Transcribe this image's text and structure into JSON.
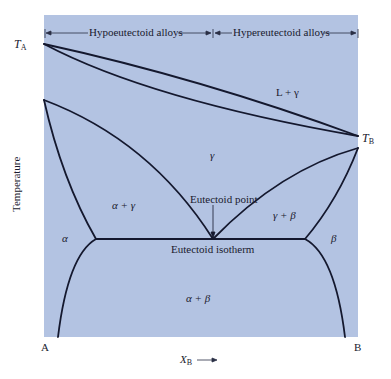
{
  "header": {
    "hypo_label": "Hypoeutectoid alloys",
    "hyper_label": "Hypereutectoid alloys"
  },
  "axes": {
    "y_title": "Temperature",
    "x_title_var": "X",
    "x_title_sub": "B",
    "left_end": "A",
    "right_end": "B",
    "ta_var": "T",
    "ta_sub": "A",
    "tb_var": "T",
    "tb_sub": "B"
  },
  "regions": {
    "l_gamma": "L + γ",
    "gamma": "γ",
    "alpha_gamma": "α + γ",
    "gamma_beta": "γ + β",
    "alpha": "α",
    "beta": "β",
    "alpha_beta": "α + β"
  },
  "annotations": {
    "eutectoid_point": "Eutectoid point",
    "eutectoid_isotherm": "Eutectoid isotherm"
  },
  "colors": {
    "panel": "#b3c3e2",
    "line": "#14182e"
  }
}
